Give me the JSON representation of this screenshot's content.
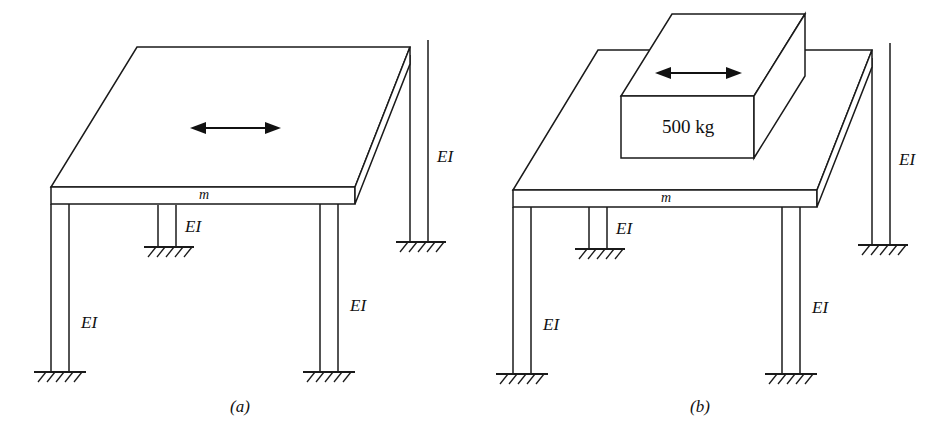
{
  "figure": {
    "background_color": "#ffffff",
    "line_color": "#1a1a1a",
    "panels": [
      {
        "id": "a",
        "caption": "(a)",
        "deck_label": "m",
        "arrow": {
          "name": "bidirectional-motion-arrow",
          "direction": "horizontal-double-headed"
        },
        "leg_labels": [
          {
            "id": "front-left",
            "text": "EI"
          },
          {
            "id": "back-middle",
            "text": "EI"
          },
          {
            "id": "front-right",
            "text": "EI"
          },
          {
            "id": "back-right",
            "text": "EI"
          }
        ],
        "supports": 4,
        "support_type": "fixed-hatched-ground"
      },
      {
        "id": "b",
        "caption": "(b)",
        "deck_label": "m",
        "block_label": "500 kg",
        "arrow": {
          "name": "bidirectional-motion-arrow",
          "direction": "horizontal-double-headed"
        },
        "leg_labels": [
          {
            "id": "front-left",
            "text": "EI"
          },
          {
            "id": "back-middle",
            "text": "EI"
          },
          {
            "id": "front-right",
            "text": "EI"
          },
          {
            "id": "back-right",
            "text": "EI"
          }
        ],
        "supports": 4,
        "support_type": "fixed-hatched-ground"
      }
    ]
  }
}
